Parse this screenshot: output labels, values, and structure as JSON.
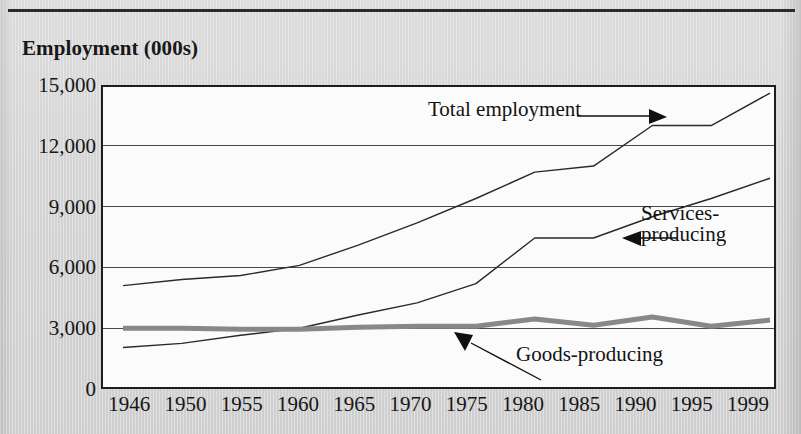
{
  "figure": {
    "title": "Employment (000s)",
    "top_rule": true,
    "background_color": "#d9d9d9",
    "plot_background_color": "#fbfbfb",
    "frame_color": "#1d1d1d"
  },
  "annotations": {
    "total": {
      "label": "Total employment",
      "arrow": "arrow-right-icon"
    },
    "services": {
      "line1": "Services-",
      "line2": "producing",
      "arrow": "arrow-left-icon"
    },
    "goods": {
      "label": "Goods-producing",
      "arrow": "arrow-up-left-icon"
    }
  },
  "chart_data": {
    "type": "line",
    "title": "Employment (000s)",
    "xlabel": "",
    "ylabel": "Employment (000s)",
    "categories": [
      "1946",
      "1950",
      "1955",
      "1960",
      "1965",
      "1970",
      "1975",
      "1980",
      "1985",
      "1990",
      "1995",
      "1999"
    ],
    "ylim": [
      0,
      15000
    ],
    "yticks": [
      0,
      3000,
      6000,
      9000,
      12000,
      15000
    ],
    "ytick_labels": [
      "0",
      "3,000",
      "6,000",
      "9,000",
      "12,000",
      "15,000"
    ],
    "grid": true,
    "grid_axis": "y",
    "legend": "annotated-inline",
    "series": [
      {
        "name": "Total employment",
        "color": "#2a2a2a",
        "width": 1.4,
        "values": [
          5100,
          5400,
          5600,
          6100,
          7100,
          8200,
          9400,
          10700,
          11000,
          13000,
          13000,
          14600
        ]
      },
      {
        "name": "Services-producing",
        "color": "#2a2a2a",
        "width": 1.4,
        "values": [
          2050,
          2250,
          2650,
          3000,
          3650,
          4250,
          5200,
          7450,
          7450,
          8500,
          9400,
          10400
        ]
      },
      {
        "name": "Goods-producing",
        "color": "#888888",
        "width": 5,
        "values": [
          3000,
          3000,
          2950,
          2950,
          3050,
          3100,
          3100,
          3450,
          3150,
          3550,
          3100,
          3400
        ]
      }
    ]
  }
}
